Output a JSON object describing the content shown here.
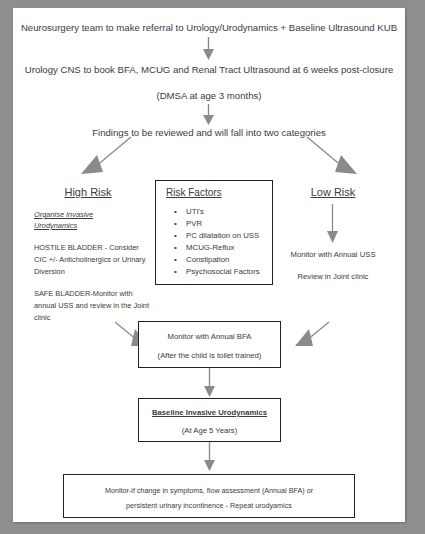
{
  "document": {
    "title": "Neurosurgery / Urology follow-up pathway flowchart",
    "background_color": "#8e8e8e",
    "page_color": "#ffffff",
    "text_color": "#3b3b3b",
    "arrow_color": "#808080",
    "box_border_color": "#222222"
  },
  "flow": {
    "step1": "Neurosurgery team to make referral to Urology/Urodynamics + Baseline Ultrasound KUB",
    "step2": "Urology CNS to book BFA, MCUG and Renal Tract Ultrasound at 6 weeks post-closure",
    "step2_note": "(DMSA at age 3 months)",
    "step3": "Findings to be reviewed and will fall into two categories"
  },
  "high_risk": {
    "heading": "High Risk",
    "subheading": "Organise Invasive Urodynamics",
    "paragraph1": "HOSTILE BLADDER - Consider CIC +/- Anticholinergics or Urinary Diversion",
    "paragraph2": "SAFE BLADDER-Monitor with annual USS and review in the Joint clinic"
  },
  "risk_factors": {
    "heading": "Risk Factors",
    "items": [
      "UTI's",
      "PVR",
      "PC dilatation on USS",
      "MCUG-Reflux",
      "Constipation",
      "Psychosocial Factors"
    ]
  },
  "low_risk": {
    "heading": "Low Risk",
    "line1": "Monitor with Annual USS",
    "line2": "Review in Joint clinic"
  },
  "monitor_bfa_box": {
    "line1": "Monitor with Annual BFA",
    "line2": "(After the child is toilet trained)"
  },
  "urodynamics_box": {
    "line1": "Baseline Invasive Urodynamics",
    "line2": "(At Age 5 Years)"
  },
  "final_box": {
    "line1": "Monitor-if change in symptoms, flow assessment (Annual BFA) or",
    "line2": "persistent urinary incontinence - Repeat urodyamics"
  }
}
